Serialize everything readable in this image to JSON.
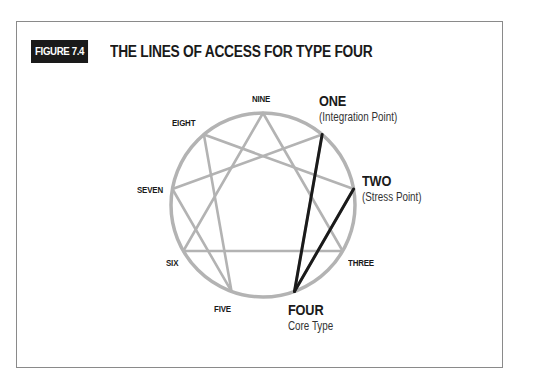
{
  "figure": {
    "badge": "FIGURE 7.4",
    "title": "THE LINES OF ACCESS FOR TYPE FOUR"
  },
  "diagram": {
    "type": "enneagram",
    "center": [
      263,
      205
    ],
    "radius": 92,
    "colors": {
      "circle": "#b3b3b3",
      "lines": "#b3b3b3",
      "highlight": "#1a1a1a",
      "text": "#1a1a1a"
    },
    "points": [
      {
        "id": 9,
        "label": "NINE"
      },
      {
        "id": 1,
        "label": "ONE",
        "sublabel": "(Integration Point)",
        "emphasis": true
      },
      {
        "id": 2,
        "label": "TWO",
        "sublabel": "(Stress Point)",
        "emphasis": true
      },
      {
        "id": 3,
        "label": "THREE"
      },
      {
        "id": 4,
        "label": "FOUR",
        "sublabel": "Core Type",
        "emphasis": true
      },
      {
        "id": 5,
        "label": "FIVE"
      },
      {
        "id": 6,
        "label": "SIX"
      },
      {
        "id": 7,
        "label": "SEVEN"
      },
      {
        "id": 8,
        "label": "EIGHT"
      }
    ],
    "gray_lines": [
      [
        3,
        6
      ],
      [
        6,
        9
      ],
      [
        9,
        3
      ],
      [
        1,
        7
      ],
      [
        7,
        5
      ],
      [
        5,
        8
      ],
      [
        8,
        2
      ],
      [
        2,
        4
      ],
      [
        4,
        1
      ]
    ],
    "highlight_lines": [
      [
        4,
        1
      ],
      [
        4,
        2
      ]
    ]
  },
  "labels": {
    "nine": "NINE",
    "one": "ONE",
    "one_sub": "(Integration Point)",
    "two": "TWO",
    "two_sub": "(Stress Point)",
    "three": "THREE",
    "four": "FOUR",
    "four_sub": "Core Type",
    "five": "FIVE",
    "six": "SIX",
    "seven": "SEVEN",
    "eight": "EIGHT"
  }
}
